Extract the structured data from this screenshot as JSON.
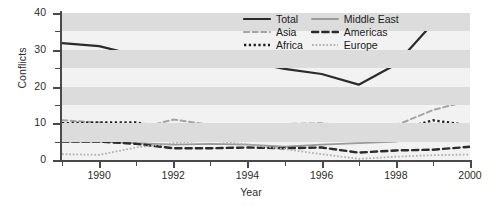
{
  "chart_data": {
    "type": "line",
    "title": "",
    "xlabel": "Year",
    "ylabel": "Conflicts",
    "xlim": [
      1989,
      2000
    ],
    "ylim": [
      0,
      40
    ],
    "x": [
      1989,
      1990,
      1991,
      1992,
      1993,
      1994,
      1995,
      1996,
      1997,
      1998,
      1999,
      2000
    ],
    "xticks_major": [
      1990,
      1992,
      1994,
      1996,
      1998,
      2000
    ],
    "xticks_minor": [
      1989,
      1991,
      1993,
      1995,
      1997,
      1999
    ],
    "yticks_major": [
      0,
      10,
      20,
      30,
      40
    ],
    "yticks_minor": [
      5,
      15,
      25,
      35
    ],
    "grid": "alternating horizontal bands every 5 units",
    "legend_position": "top-right inside plot",
    "series": [
      {
        "name": "Total",
        "style": "solid",
        "color": "#2b2b2b",
        "width": 2.2,
        "values": [
          31.8,
          31.0,
          28.5,
          28.4,
          28.0,
          26.8,
          24.8,
          23.4,
          20.5,
          26.0,
          37.2,
          38.8
        ]
      },
      {
        "name": "Middle East",
        "style": "solid",
        "color": "#9a9a9a",
        "width": 1.8,
        "values": [
          5.0,
          5.0,
          4.6,
          4.2,
          4.4,
          4.2,
          3.6,
          4.2,
          4.6,
          5.0,
          7.0,
          5.8
        ]
      },
      {
        "name": "Asia",
        "style": "dashed",
        "color": "#a5a5a5",
        "width": 2.0,
        "values": [
          10.8,
          10.2,
          8.4,
          11.0,
          9.6,
          9.6,
          9.8,
          10.0,
          9.0,
          9.4,
          13.6,
          16.2
        ]
      },
      {
        "name": "Americas",
        "style": "dashed",
        "color": "#2b2b2b",
        "width": 2.4,
        "values": [
          5.0,
          5.0,
          4.4,
          3.2,
          3.2,
          3.4,
          3.2,
          3.4,
          2.0,
          2.6,
          2.8,
          3.6
        ]
      },
      {
        "name": "Africa",
        "style": "dotted",
        "color": "#1f1f1f",
        "width": 2.4,
        "values": [
          10.0,
          10.2,
          10.2,
          8.2,
          7.2,
          6.4,
          6.0,
          5.2,
          5.4,
          8.0,
          10.8,
          9.4
        ]
      },
      {
        "name": "Europe",
        "style": "dotted",
        "color": "#b0b0b0",
        "width": 1.8,
        "values": [
          1.6,
          1.4,
          3.4,
          4.6,
          5.4,
          4.2,
          3.0,
          1.6,
          0.3,
          0.9,
          1.3,
          1.5
        ]
      }
    ]
  },
  "axes": {
    "ylabel": "Conflicts",
    "xlabel": "Year",
    "ytick_labels": [
      "0",
      "10",
      "20",
      "30",
      "40"
    ],
    "xtick_labels": [
      "1990",
      "1992",
      "1994",
      "1996",
      "1998",
      "2000"
    ]
  },
  "legend": {
    "entries": [
      {
        "label": "Total",
        "style": "solid"
      },
      {
        "label": "Middle East",
        "style": "solid"
      },
      {
        "label": "Asia",
        "style": "dashed"
      },
      {
        "label": "Americas",
        "style": "dashed"
      },
      {
        "label": "Africa",
        "style": "dotted"
      },
      {
        "label": "Europe",
        "style": "dotted"
      }
    ]
  },
  "colors": {
    "plot_background": "#f2f2f2",
    "band": "#dcdcdc",
    "axis": "#4a4a4a",
    "text": "#2b2b2b"
  }
}
